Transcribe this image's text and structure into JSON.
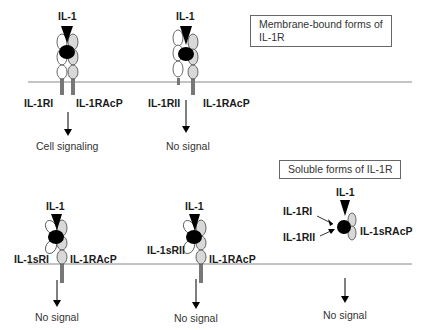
{
  "legend": {
    "membrane": "Membrane-bound forms of IL-1R",
    "soluble": "Soluble forms of IL-1R"
  },
  "membrane_bound": [
    {
      "ligand": "IL-1",
      "receptor": "IL-1RI",
      "accessory": "IL-1RAcP",
      "outcome": "Cell signaling"
    },
    {
      "ligand": "IL-1",
      "receptor": "IL-1RII",
      "accessory": "IL-1RAcP",
      "outcome": "No signal"
    }
  ],
  "soluble": [
    {
      "ligand": "IL-1",
      "receptor": "IL-1sRI",
      "accessory": "IL-1RAcP",
      "outcome": "No signal"
    },
    {
      "ligand": "IL-1",
      "receptor": "IL-1sRII",
      "accessory": "IL-1RAcP",
      "outcome": "No signal"
    },
    {
      "ligand": "IL-1",
      "receptor_a": "IL-1RI",
      "receptor_b": "IL-1RII",
      "accessory": "IL-1sRAcP",
      "outcome": "No signal"
    }
  ],
  "colors": {
    "ligand": "#000000",
    "membrane": "#888888",
    "domain_fill": "#ffffff",
    "accessory_fill": "#d8d8d8",
    "stalk": "#777777"
  }
}
